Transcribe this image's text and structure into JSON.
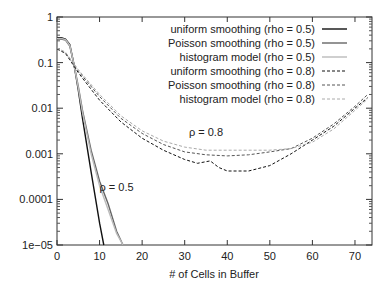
{
  "chart_data": {
    "type": "line",
    "title": "",
    "xlabel": "# of Cells in Buffer",
    "ylabel": "",
    "yscale": "log",
    "xlim": [
      0,
      74
    ],
    "ylim": [
      1e-05,
      1
    ],
    "x_ticks": [
      "0",
      "10",
      "20",
      "30",
      "40",
      "50",
      "60",
      "70"
    ],
    "y_ticks": [
      "1e-05",
      "0.0001",
      "0.001",
      "0.01",
      "0.1",
      "1"
    ],
    "grid": false,
    "legend_position": "upper right",
    "annotations": [
      {
        "text": "ρ = 0.8",
        "x": 35,
        "y": 0.0025
      },
      {
        "text": "ρ = 0.5",
        "x": 14,
        "y": 0.00015
      }
    ],
    "series": [
      {
        "name": "uniform smoothing (rho = 0.5)",
        "style": "solid",
        "color": "#111111",
        "x": [
          0,
          1,
          2,
          3,
          4,
          5,
          6,
          8,
          10,
          11
        ],
        "values": [
          0.35,
          0.35,
          0.33,
          0.25,
          0.09,
          0.025,
          0.006,
          0.0004,
          3e-05,
          1e-05
        ]
      },
      {
        "name": "Poisson smoothing (rho = 0.5)",
        "style": "solid",
        "color": "#666666",
        "x": [
          0,
          1,
          2,
          3,
          4,
          5,
          6,
          8,
          10,
          12,
          14,
          15.5
        ],
        "values": [
          0.33,
          0.33,
          0.31,
          0.23,
          0.09,
          0.03,
          0.009,
          0.0012,
          0.00025,
          8e-05,
          2e-05,
          1e-05
        ]
      },
      {
        "name": "histogram model (rho = 0.5)",
        "style": "solid",
        "color": "#bbbbbb",
        "x": [
          0,
          1,
          2,
          3,
          4,
          5,
          6,
          8,
          10,
          12,
          14,
          15.5
        ],
        "values": [
          0.34,
          0.34,
          0.32,
          0.24,
          0.09,
          0.028,
          0.008,
          0.001,
          0.0002,
          6e-05,
          1.8e-05,
          1e-05
        ]
      },
      {
        "name": "uniform smoothing (rho = 0.8)",
        "style": "dashed",
        "color": "#111111",
        "x": [
          0,
          2,
          5,
          10,
          15,
          20,
          25,
          30,
          33,
          36,
          38,
          40,
          45,
          50,
          55,
          60,
          65,
          70,
          73
        ],
        "values": [
          0.2,
          0.16,
          0.06,
          0.015,
          0.005,
          0.0022,
          0.0012,
          0.00075,
          0.00062,
          0.0007,
          0.0005,
          0.00042,
          0.00042,
          0.00055,
          0.001,
          0.002,
          0.004,
          0.01,
          0.017
        ]
      },
      {
        "name": "Poisson smoothing (rho = 0.8)",
        "style": "dashed",
        "color": "#555555",
        "x": [
          0,
          2,
          5,
          10,
          15,
          20,
          25,
          30,
          35,
          40,
          45,
          50,
          55,
          60,
          65,
          70,
          73
        ],
        "values": [
          0.2,
          0.16,
          0.065,
          0.018,
          0.006,
          0.0028,
          0.0016,
          0.0011,
          0.00095,
          0.0009,
          0.00095,
          0.0011,
          0.0013,
          0.0022,
          0.0045,
          0.011,
          0.02
        ]
      },
      {
        "name": "histogram model (rho = 0.8)",
        "style": "dashed",
        "color": "#aaaaaa",
        "x": [
          0,
          2,
          5,
          10,
          15,
          20,
          25,
          30,
          35,
          40,
          45,
          50,
          55,
          60,
          65,
          70,
          73
        ],
        "values": [
          0.21,
          0.17,
          0.07,
          0.02,
          0.0068,
          0.0032,
          0.0019,
          0.0014,
          0.0012,
          0.0012,
          0.0012,
          0.0012,
          0.0013,
          0.0018,
          0.0035,
          0.009,
          0.016
        ]
      }
    ]
  }
}
